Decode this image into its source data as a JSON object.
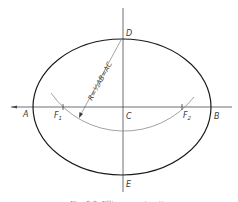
{
  "figure": {
    "labels": {
      "A": "A",
      "B": "B",
      "C": "C",
      "D": "D",
      "E": "E",
      "F1": "F",
      "F1_sub": "1",
      "F2": "F",
      "F2_sub": "2"
    },
    "formula": "R=½AB=AC",
    "caption": "Fig. 9-9. Ellipse construction",
    "colors": {
      "ellipse": "#1a1a1a",
      "axes": "#4a4a4a",
      "arc": "#8a8a8a",
      "text": "#3a3a3a"
    }
  }
}
